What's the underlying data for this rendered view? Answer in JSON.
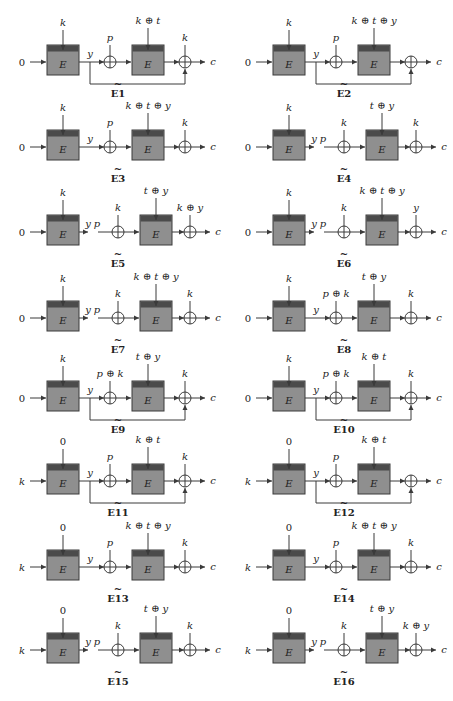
{
  "figure": {
    "columns": 2,
    "colors": {
      "box_fill": "#8f8f8f",
      "box_band": "#4b4b4b",
      "line": "#3a3a3a",
      "background": "#ffffff"
    },
    "diagrams": [
      {
        "id": "E1",
        "caption": "E1",
        "col": 0,
        "row": 0,
        "input": "0",
        "key1": "k",
        "style": "connected",
        "y_label": "y",
        "p_label": "p",
        "key2": "k ⊕ t",
        "out_xor": "k",
        "feedback": true,
        "output": "c"
      },
      {
        "id": "E2",
        "caption": "E2",
        "col": 1,
        "row": 0,
        "input": "0",
        "key1": "k",
        "style": "connected",
        "y_label": "y",
        "p_label": "p",
        "key2": "k ⊕ t ⊕ y",
        "out_xor": "",
        "feedback": true,
        "output": "c"
      },
      {
        "id": "E3",
        "caption": "E3",
        "col": 0,
        "row": 1,
        "input": "0",
        "key1": "k",
        "style": "connected",
        "y_label": "y",
        "p_label": "p",
        "key2": "k ⊕ t ⊕ y",
        "out_xor": "k",
        "feedback": false,
        "output": "c"
      },
      {
        "id": "E4",
        "caption": "E4",
        "col": 1,
        "row": 1,
        "input": "0",
        "key1": "k",
        "style": "split",
        "y_label": "y",
        "p_label": "p",
        "p_xor": "k",
        "key2": "t ⊕ y",
        "out_xor": "k",
        "feedback": false,
        "output": "c"
      },
      {
        "id": "E5",
        "caption": "E5",
        "col": 0,
        "row": 2,
        "input": "0",
        "key1": "k",
        "style": "split",
        "y_label": "y",
        "p_label": "p",
        "p_xor": "k",
        "key2": "t ⊕ y",
        "out_xor": "k ⊕ y",
        "feedback": false,
        "output": "c"
      },
      {
        "id": "E6",
        "caption": "E6",
        "col": 1,
        "row": 2,
        "input": "0",
        "key1": "k",
        "style": "split",
        "y_label": "y",
        "p_label": "p",
        "p_xor": "k",
        "key2": "k ⊕ t ⊕ y",
        "out_xor": "y",
        "feedback": false,
        "output": "c"
      },
      {
        "id": "E7",
        "caption": "E7",
        "col": 0,
        "row": 3,
        "input": "0",
        "key1": "k",
        "style": "split",
        "y_label": "y",
        "p_label": "p",
        "p_xor": "k",
        "key2": "k ⊕ t ⊕ y",
        "out_xor": "k",
        "feedback": false,
        "output": "c"
      },
      {
        "id": "E8",
        "caption": "E8",
        "col": 1,
        "row": 3,
        "input": "0",
        "key1": "k",
        "style": "connected",
        "y_label": "y",
        "p_label": "p ⊕ k",
        "key2": "t ⊕ y",
        "out_xor": "k",
        "feedback": false,
        "output": "c"
      },
      {
        "id": "E9",
        "caption": "E9",
        "col": 0,
        "row": 4,
        "input": "0",
        "key1": "k",
        "style": "connected",
        "y_label": "y",
        "p_label": "p ⊕ k",
        "key2": "t ⊕ y",
        "out_xor": "k",
        "feedback": true,
        "output": "c"
      },
      {
        "id": "E10",
        "caption": "E10",
        "col": 1,
        "row": 4,
        "input": "0",
        "key1": "k",
        "style": "connected",
        "y_label": "y",
        "p_label": "p ⊕ k",
        "key2": "k ⊕ t",
        "out_xor": "k",
        "feedback": true,
        "output": "c"
      },
      {
        "id": "E11",
        "caption": "E11",
        "col": 0,
        "row": 5,
        "input": "k",
        "key1": "0",
        "style": "connected",
        "y_label": "y",
        "p_label": "p",
        "key2": "k ⊕ t",
        "out_xor": "k",
        "feedback": true,
        "output": "c"
      },
      {
        "id": "E12",
        "caption": "E12",
        "col": 1,
        "row": 5,
        "input": "k",
        "key1": "0",
        "style": "connected",
        "y_label": "y",
        "p_label": "p",
        "key2": "k ⊕ t",
        "out_xor": "",
        "feedback": true,
        "output": "c"
      },
      {
        "id": "E13",
        "caption": "E13",
        "col": 0,
        "row": 6,
        "input": "k",
        "key1": "0",
        "style": "connected",
        "y_label": "y",
        "p_label": "p",
        "key2": "k ⊕ t ⊕ y",
        "out_xor": "k",
        "feedback": false,
        "output": "c"
      },
      {
        "id": "E14",
        "caption": "E14",
        "col": 1,
        "row": 6,
        "input": "k",
        "key1": "0",
        "style": "connected",
        "y_label": "y",
        "p_label": "p",
        "key2": "k ⊕ t ⊕ y",
        "out_xor": "k",
        "feedback": false,
        "output": "c"
      },
      {
        "id": "E15",
        "caption": "E15",
        "col": 0,
        "row": 7,
        "input": "k",
        "key1": "0",
        "style": "split",
        "y_label": "y",
        "p_label": "p",
        "p_xor": "k",
        "key2": "t ⊕ y",
        "out_xor": "k",
        "feedback": false,
        "output": "c"
      },
      {
        "id": "E16",
        "caption": "E16",
        "col": 1,
        "row": 7,
        "input": "k",
        "key1": "0",
        "style": "split",
        "y_label": "y",
        "p_label": "p",
        "p_xor": "k",
        "key2": "t ⊕ y",
        "out_xor": "k ⊕ y",
        "feedback": false,
        "output": "c"
      }
    ],
    "box_label": "E"
  }
}
